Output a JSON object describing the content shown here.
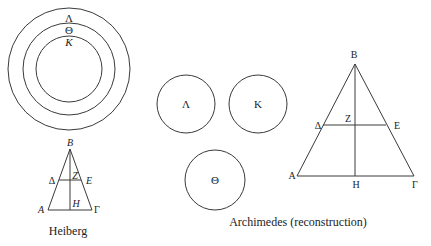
{
  "heiberg": {
    "circles": {
      "labels": [
        "Λ",
        "Θ",
        "K"
      ]
    },
    "triangle": {
      "labels": {
        "B": "B",
        "Delta": "Δ",
        "Z": "Z",
        "E": "E",
        "A": "A",
        "H": "H",
        "Gamma": "Γ"
      }
    },
    "caption": "Heiberg"
  },
  "archimedes": {
    "circles": {
      "labels": [
        "Λ",
        "K",
        "Θ"
      ]
    },
    "triangle": {
      "labels": {
        "B": "B",
        "Delta": "Δ",
        "Z": "Z",
        "E": "E",
        "A": "A",
        "H": "H",
        "Gamma": "Γ"
      }
    },
    "caption": "Archimedes (reconstruction)"
  }
}
